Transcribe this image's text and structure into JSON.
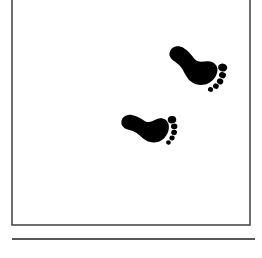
{
  "canvas": {
    "width": 262,
    "height": 258,
    "background_color": "#ffffff",
    "description": "Plain white figure panel containing two black footprint silhouettes"
  },
  "frame": {
    "name": "panel-border",
    "stroke_color": "#4a4a4a",
    "stroke_width": 1.6,
    "x": 12,
    "y": -6,
    "width": 238,
    "height": 231,
    "note": "Thin rectangular outline; top edge is cropped off above the image top"
  },
  "divider": {
    "name": "horizontal-rule",
    "stroke_color": "#585858",
    "stroke_width": 1.8,
    "x1": 12,
    "y1": 239,
    "x2": 255,
    "y2": 239
  },
  "footprints": {
    "count": 2,
    "fill_color": "#000000",
    "items": [
      {
        "id": "footprint-upper",
        "label": "Upper right footprint",
        "side": "right",
        "center_x": 192,
        "center_y": 66,
        "rotation_deg": 28,
        "scale": 1.0,
        "toe_count": 5
      },
      {
        "id": "footprint-lower",
        "label": "Lower left footprint",
        "side": "right",
        "center_x": 145,
        "center_y": 128,
        "rotation_deg": 8,
        "scale": 0.92,
        "toe_count": 5
      }
    ]
  },
  "accessibility": {
    "figure_caption": "Two black footprint silhouettes inside a thin rectangular frame"
  }
}
